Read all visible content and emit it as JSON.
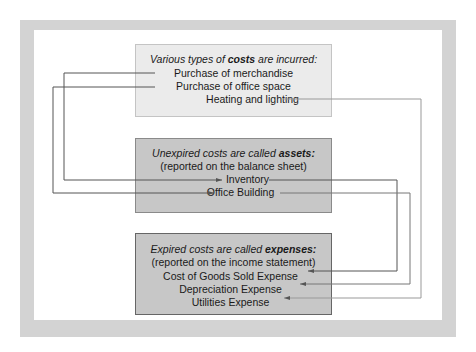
{
  "diagram": {
    "top_box": {
      "heading_pre": "Various types of ",
      "heading_bold": "costs",
      "heading_post": " are incurred:",
      "items": [
        "Purchase of merchandise",
        "Purchase of office space",
        "Heating and lighting"
      ]
    },
    "middle_box": {
      "heading_pre": "Unexpired costs are called ",
      "heading_bold": "assets:",
      "subheading": "(reported on the balance sheet)",
      "items": [
        "Inventory",
        "Office Building"
      ]
    },
    "bottom_box": {
      "heading_pre": "Expired costs are called ",
      "heading_bold": "expenses:",
      "subheading": "(reported on the income statement)",
      "items": [
        "Cost of Goods Sold Expense",
        "Depreciation Expense",
        "Utilities Expense"
      ]
    },
    "connections": [
      {
        "from": "Purchase of merchandise",
        "to": "Inventory"
      },
      {
        "from": "Purchase of office space",
        "to": "Office Building"
      },
      {
        "from": "Heating and lighting",
        "to": "Utilities Expense"
      },
      {
        "from": "Inventory",
        "to": "Cost of Goods Sold Expense"
      },
      {
        "from": "Office Building",
        "to": "Depreciation Expense"
      }
    ],
    "colors": {
      "frame": "#d3d3d3",
      "top_box_fill": "#ebebeb",
      "lower_box_fill": "#c7c7c7",
      "line": "#555555"
    }
  }
}
